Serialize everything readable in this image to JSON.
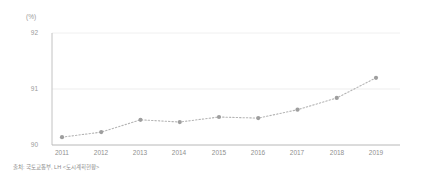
{
  "chart_data": {
    "type": "line",
    "title": "",
    "subtitle": "",
    "xlabel": "",
    "ylabel": "",
    "unit_label": "(%)",
    "categories": [
      "2011",
      "2012",
      "2013",
      "2014",
      "2015",
      "2016",
      "2017",
      "2018",
      "2019"
    ],
    "values": [
      90.14,
      90.23,
      90.45,
      90.41,
      90.5,
      90.48,
      90.63,
      90.84,
      91.2
    ],
    "series": [
      {
        "name": "",
        "values": [
          90.14,
          90.23,
          90.45,
          90.41,
          90.5,
          90.48,
          90.63,
          90.84,
          91.2
        ]
      }
    ],
    "ylim": [
      90,
      92
    ],
    "yticks": [
      90,
      91,
      92
    ],
    "ytick_labels": [
      "90",
      "91",
      "92"
    ],
    "grid": true,
    "grid_axis": "y",
    "legend": false,
    "legend_position": "none",
    "line_style": "dotted",
    "marker": "circle",
    "colors": {
      "line": "#b4b4b4",
      "marker": "#9e9e9e",
      "grid": "#e8e8e8",
      "axis": "#bdbdbd",
      "text": "#9a9a9a"
    }
  },
  "source": {
    "note": "출처: 국토교통부, LH <도시계획현황>"
  }
}
